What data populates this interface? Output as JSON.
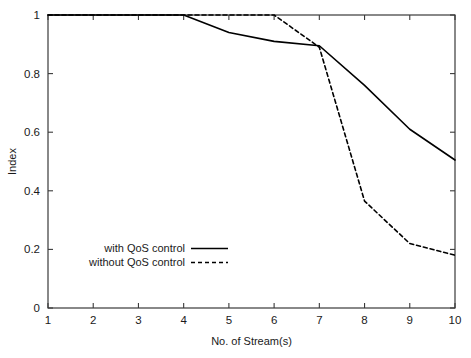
{
  "chart_data": {
    "type": "line",
    "title": "",
    "xlabel": "No. of Stream(s)",
    "ylabel": "Index",
    "xlim": [
      1,
      10
    ],
    "ylim": [
      0,
      1
    ],
    "xticks": [
      "1",
      "2",
      "3",
      "4",
      "5",
      "6",
      "7",
      "8",
      "9",
      "10"
    ],
    "yticks": [
      "0",
      "0.2",
      "0.4",
      "0.6",
      "0.8",
      "1"
    ],
    "grid": false,
    "legend_position": "lower-left-inside",
    "x": [
      1,
      2,
      3,
      4,
      5,
      6,
      7,
      8,
      9,
      10
    ],
    "series": [
      {
        "name": "with QoS control",
        "style": "solid",
        "color": "#000000",
        "values": [
          1.0,
          1.0,
          1.0,
          1.0,
          0.94,
          0.91,
          0.895,
          0.76,
          0.61,
          0.505
        ]
      },
      {
        "name": "without QoS control",
        "style": "dashed",
        "color": "#000000",
        "values": [
          1.0,
          1.0,
          1.0,
          1.0,
          1.0,
          1.0,
          0.89,
          0.365,
          0.22,
          0.18
        ]
      }
    ]
  },
  "legend": {
    "entries": [
      {
        "label": "with QoS control",
        "style": "solid"
      },
      {
        "label": "without QoS control",
        "style": "dashed"
      }
    ]
  },
  "axes": {
    "x_label": "No. of Stream(s)",
    "y_label": "Index"
  }
}
